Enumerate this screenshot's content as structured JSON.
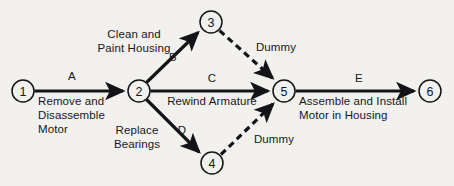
{
  "diagram": {
    "type": "activity-on-arrow network",
    "colors": {
      "background": "#f2f1ee",
      "stroke": "#141418",
      "text": "#17171b"
    },
    "nodes": [
      {
        "id": "1",
        "label": "1",
        "cx": 23,
        "cy": 91,
        "r": 11
      },
      {
        "id": "2",
        "label": "2",
        "cx": 139,
        "cy": 91,
        "r": 11
      },
      {
        "id": "3",
        "label": "3",
        "cx": 211,
        "cy": 22,
        "r": 11
      },
      {
        "id": "4",
        "label": "4",
        "cx": 212,
        "cy": 163,
        "r": 11
      },
      {
        "id": "5",
        "label": "5",
        "cx": 284,
        "cy": 91,
        "r": 11
      },
      {
        "id": "6",
        "label": "6",
        "cx": 430,
        "cy": 91,
        "r": 11
      }
    ],
    "edges": [
      {
        "id": "A",
        "from": "1",
        "to": "2",
        "style": "solid",
        "code": "A"
      },
      {
        "id": "B",
        "from": "2",
        "to": "3",
        "style": "solid",
        "code": "B"
      },
      {
        "id": "C",
        "from": "2",
        "to": "5",
        "style": "solid",
        "code": "C"
      },
      {
        "id": "D",
        "from": "2",
        "to": "4",
        "style": "solid",
        "code": "D"
      },
      {
        "id": "E",
        "from": "5",
        "to": "6",
        "style": "solid",
        "code": "E"
      },
      {
        "id": "dummy-top",
        "from": "3",
        "to": "5",
        "style": "dashed",
        "code": "Dummy"
      },
      {
        "id": "dummy-bottom",
        "from": "4",
        "to": "5",
        "style": "dashed",
        "code": "Dummy"
      }
    ],
    "labels": {
      "edge_a_code": "A",
      "edge_a_desc_line1": "Remove and",
      "edge_a_desc_line2": "Disassemble",
      "edge_a_desc_line3": "Motor",
      "edge_b_code": "B",
      "edge_b_desc_line1": "Clean and",
      "edge_b_desc_line2": "Paint Housing",
      "edge_c_code": "C",
      "edge_c_desc_line1": "Rewind Armature",
      "edge_d_code": "D",
      "edge_d_desc_line1": "Replace",
      "edge_d_desc_line2": "Bearings",
      "edge_e_code": "E",
      "edge_e_desc_line1": "Assemble and Install",
      "edge_e_desc_line2": "Motor in Housing",
      "dummy_top": "Dummy",
      "dummy_bottom": "Dummy"
    }
  }
}
